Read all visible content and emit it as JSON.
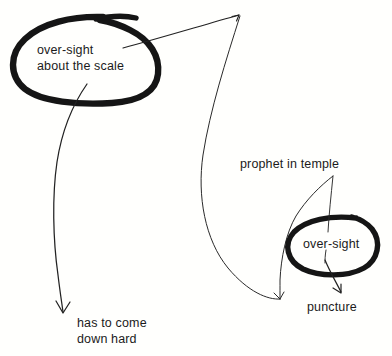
{
  "diagram": {
    "background_color": "#fffffd",
    "ink_color": "#1b1b1b",
    "width": 392,
    "height": 356,
    "annotations": [
      {
        "id": "over-sight-scale",
        "text": "over-sight\nabout the scale",
        "circled": true,
        "circle_style": "thick-hand-drawn-ellipse"
      },
      {
        "id": "prophet-in-temple",
        "text": "prophet in temple",
        "circled": false
      },
      {
        "id": "over-sight-small",
        "text": "over-sight",
        "circled": true,
        "circle_style": "thick-hand-drawn-ellipse"
      },
      {
        "id": "puncture",
        "text": "puncture",
        "circled": false
      },
      {
        "id": "has-to-come-down-hard",
        "text": "has to come\ndown hard",
        "circled": false
      }
    ],
    "arrows": [
      {
        "id": "scale-to-topright",
        "from": "over-sight-scale",
        "to": "top-right-apex"
      },
      {
        "id": "scale-to-has-to-come",
        "from": "over-sight-scale",
        "to": "has-to-come-down-hard"
      },
      {
        "id": "topright-to-convergence",
        "from": "top-right-apex",
        "to": "lower-middle-point"
      },
      {
        "id": "prophet-to-convergence",
        "from": "prophet-in-temple",
        "to": "lower-middle-point"
      },
      {
        "id": "oversight-to-puncture",
        "from": "over-sight-small",
        "to": "puncture"
      }
    ]
  },
  "text": {
    "over_sight_scale_line1": "over-sight",
    "over_sight_scale_line2": "about the scale",
    "prophet_in_temple": "prophet in temple",
    "over_sight_small": "over-sight",
    "puncture": "puncture",
    "has_to_come_line1": "has to come",
    "has_to_come_line2": "down hard"
  }
}
